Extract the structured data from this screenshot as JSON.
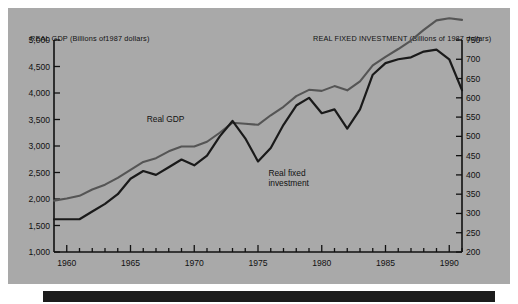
{
  "titles": {
    "left_axis": "REAL GDP (Billions of1987 dollars)",
    "right_axis": "REAL FIXED INVESTMENT (Billions of 1987 dollars)"
  },
  "series_labels": {
    "gdp": "Real GDP",
    "investment_line1": "Real fixed",
    "investment_line2": "investment"
  },
  "colors": {
    "background": "#a9a9a9",
    "gdp_line": "#555555",
    "investment_line": "#1a1a1a",
    "axis": "#111111",
    "footer": "#1c1c1c"
  },
  "chart_data": {
    "type": "line",
    "title": "",
    "xlabel": "",
    "ylabel": "REAL GDP (Billions of1987 dollars)",
    "y2label": "REAL FIXED INVESTMENT (Billions of 1987 dollars)",
    "grid": false,
    "legend": "inline-annotation",
    "xlim": [
      1959,
      1991
    ],
    "ylim": [
      1000,
      5000
    ],
    "y2lim": [
      200,
      750
    ],
    "xticks": [
      1960,
      1965,
      1970,
      1975,
      1980,
      1985,
      1990
    ],
    "xtick_labels": [
      "1960",
      "1965",
      "1970",
      "1975",
      "1980",
      "1985",
      "1990"
    ],
    "xminor_step": 1,
    "yticks": [
      1000,
      1500,
      2000,
      2500,
      3000,
      3500,
      4000,
      4500,
      5000
    ],
    "ytick_labels": [
      "1,000",
      "1,500",
      "2,000",
      "2,500",
      "3,000",
      "3,500",
      "4,000",
      "4,500",
      "5,000"
    ],
    "y2ticks": [
      200,
      250,
      300,
      350,
      400,
      450,
      500,
      550,
      600,
      650,
      700,
      750
    ],
    "y2tick_labels": [
      "200",
      "250",
      "300",
      "350",
      "400",
      "450",
      "500",
      "550",
      "600",
      "650",
      "700",
      "750"
    ],
    "x": [
      1959,
      1960,
      1961,
      1962,
      1963,
      1964,
      1965,
      1966,
      1967,
      1968,
      1969,
      1970,
      1971,
      1972,
      1973,
      1974,
      1975,
      1976,
      1977,
      1978,
      1979,
      1980,
      1981,
      1982,
      1983,
      1984,
      1985,
      1986,
      1987,
      1988,
      1989,
      1990,
      1991
    ],
    "series": [
      {
        "name": "Real GDP",
        "axis": "left",
        "color": "#555555",
        "values": [
          1970,
          2010,
          2060,
          2180,
          2270,
          2400,
          2550,
          2700,
          2770,
          2900,
          2990,
          2990,
          3080,
          3250,
          3440,
          3420,
          3400,
          3580,
          3740,
          3940,
          4060,
          4040,
          4130,
          4050,
          4220,
          4520,
          4680,
          4830,
          4990,
          5190,
          5370,
          5410,
          5380
        ]
      },
      {
        "name": "Real fixed investment",
        "axis": "right",
        "color": "#1a1a1a",
        "values": [
          285,
          285,
          285,
          305,
          325,
          350,
          390,
          410,
          400,
          420,
          440,
          425,
          450,
          500,
          540,
          495,
          435,
          470,
          530,
          580,
          600,
          560,
          570,
          520,
          570,
          660,
          690,
          700,
          705,
          720,
          725,
          700,
          620
        ]
      }
    ],
    "annotations": [
      {
        "text": "Real GDP",
        "x": 1968,
        "y": 3500
      },
      {
        "text": "Real fixed investment",
        "x": 1975.5,
        "y": 2450
      }
    ]
  }
}
